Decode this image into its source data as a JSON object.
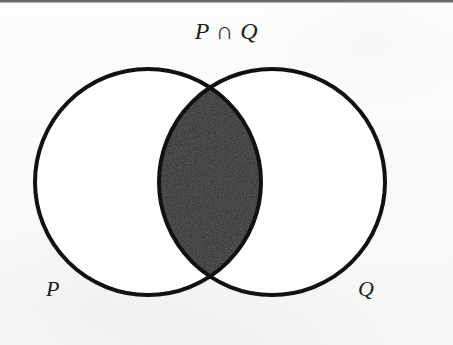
{
  "figure": {
    "kind": "venn-diagram",
    "width": 453,
    "height": 345,
    "background_color": "#fbfbfb",
    "title": "P ∩ Q",
    "title_meaning": "P intersect Q"
  },
  "labels": {
    "title": "P ∩ Q",
    "left_set": "P",
    "right_set": "Q"
  },
  "colors": {
    "paper": "#fbfbfb",
    "outline": "#111113",
    "intersection_fill": "#2e2e30",
    "circle_fill": "#ffffff",
    "top_strip": "#6b6b70",
    "text": "#1c1c1e"
  },
  "geometry": {
    "left_circle": {
      "cx": 148,
      "cy": 182,
      "r": 113
    },
    "right_circle": {
      "cx": 272,
      "cy": 182,
      "r": 113
    },
    "stroke_width": 4,
    "intersection_top_point": {
      "x": 210,
      "y": 88
    },
    "intersection_bottom_point": {
      "x": 210,
      "y": 277
    },
    "intersection_left_extent_x": 163,
    "intersection_right_extent_x": 257
  },
  "shading": {
    "shaded_region": "intersection",
    "description": "The lens-shaped overlap of circles P and Q is filled solid dark; the non-overlapping parts of both circles are left unshaded."
  }
}
